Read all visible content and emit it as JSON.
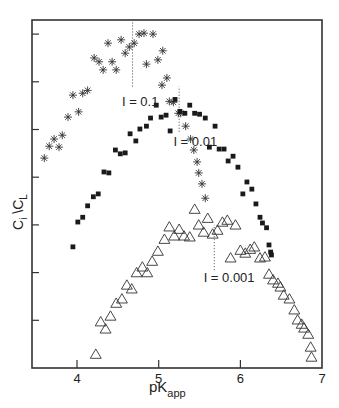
{
  "chart_data": {
    "type": "scatter",
    "title": "",
    "xlabel": "pK",
    "xlabel_subscript": "app",
    "ylabel": "C",
    "ylabel_sub1": "i",
    "ylabel_mid": " \\C",
    "ylabel_sub2": "L",
    "xlim": [
      3.45,
      7.0
    ],
    "ylim": [
      0,
      7.3
    ],
    "x_ticks": [
      4,
      5,
      6,
      7
    ],
    "x_tick_labels": [
      "4",
      "5",
      "6",
      "7"
    ],
    "y_ticks": [
      1,
      2,
      3,
      4,
      5,
      6,
      7
    ],
    "y_tick_labels": [
      "",
      "",
      "",
      "",
      "",
      "",
      ""
    ],
    "grid": false,
    "legend": "none (series labeled inline)",
    "annotations": [
      {
        "text": "I = 0.1",
        "x": 4.55,
        "y": 5.5,
        "marker_line_x": 4.68,
        "line_y": [
          5.9,
          7.3
        ]
      },
      {
        "text": "I = 0.01",
        "x": 5.18,
        "y": 4.65,
        "marker_line_x": 5.25,
        "line_y": [
          4.95,
          5.9
        ]
      },
      {
        "text": "I = 0.001",
        "x": 5.55,
        "y": 1.8,
        "marker_line_x": 5.68,
        "line_y": [
          2.05,
          3.0
        ]
      }
    ],
    "series": [
      {
        "name": "I = 0.1",
        "marker": "asterisk",
        "points": [
          [
            3.6,
            4.4
          ],
          [
            3.66,
            4.65
          ],
          [
            3.72,
            4.8
          ],
          [
            3.78,
            4.63
          ],
          [
            3.82,
            4.88
          ],
          [
            3.89,
            5.26
          ],
          [
            3.95,
            5.72
          ],
          [
            4.02,
            5.37
          ],
          [
            4.07,
            5.76
          ],
          [
            4.13,
            5.82
          ],
          [
            4.21,
            6.5
          ],
          [
            4.27,
            6.42
          ],
          [
            4.32,
            6.25
          ],
          [
            4.38,
            6.81
          ],
          [
            4.43,
            6.42
          ],
          [
            4.48,
            6.25
          ],
          [
            4.54,
            6.88
          ],
          [
            4.59,
            6.6
          ],
          [
            4.64,
            6.73
          ],
          [
            4.7,
            6.81
          ],
          [
            4.76,
            7.0
          ],
          [
            4.82,
            7.02
          ],
          [
            4.93,
            7.0
          ],
          [
            4.85,
            6.37
          ],
          [
            4.99,
            6.46
          ],
          [
            5.05,
            6.65
          ],
          [
            5.1,
            6.08
          ],
          [
            5.04,
            5.93
          ],
          [
            5.13,
            5.59
          ],
          [
            5.18,
            5.57
          ],
          [
            5.24,
            5.34
          ],
          [
            5.27,
            5.34
          ],
          [
            5.33,
            5.07
          ],
          [
            5.39,
            4.8
          ],
          [
            5.43,
            4.57
          ],
          [
            5.47,
            4.32
          ],
          [
            5.49,
            4.09
          ],
          [
            5.53,
            3.86
          ],
          [
            5.57,
            3.56
          ]
        ]
      },
      {
        "name": "I = 0.01",
        "marker": "square",
        "points": [
          [
            3.95,
            2.54
          ],
          [
            4.01,
            3.06
          ],
          [
            4.07,
            3.16
          ],
          [
            4.13,
            3.4
          ],
          [
            4.2,
            3.59
          ],
          [
            4.26,
            3.65
          ],
          [
            4.33,
            4.11
          ],
          [
            4.39,
            4.09
          ],
          [
            4.47,
            4.57
          ],
          [
            4.53,
            4.49
          ],
          [
            4.59,
            4.51
          ],
          [
            4.65,
            4.91
          ],
          [
            4.72,
            4.76
          ],
          [
            4.77,
            5.01
          ],
          [
            4.85,
            5.07
          ],
          [
            4.9,
            5.24
          ],
          [
            4.97,
            5.51
          ],
          [
            5.03,
            5.26
          ],
          [
            5.09,
            5.3
          ],
          [
            5.14,
            4.97
          ],
          [
            5.2,
            5.63
          ],
          [
            5.26,
            5.38
          ],
          [
            5.32,
            5.34
          ],
          [
            5.38,
            5.51
          ],
          [
            5.44,
            5.34
          ],
          [
            5.5,
            5.32
          ],
          [
            5.57,
            5.24
          ],
          [
            5.69,
            5.07
          ],
          [
            5.62,
            4.63
          ],
          [
            5.74,
            4.59
          ],
          [
            5.8,
            4.59
          ],
          [
            5.91,
            4.44
          ],
          [
            5.85,
            4.34
          ],
          [
            5.97,
            4.21
          ],
          [
            6.08,
            3.9
          ],
          [
            6.14,
            3.75
          ],
          [
            6.03,
            3.65
          ],
          [
            6.19,
            3.44
          ],
          [
            6.24,
            3.16
          ],
          [
            6.27,
            3.04
          ],
          [
            6.32,
            2.94
          ],
          [
            6.35,
            2.58
          ],
          [
            6.37,
            2.43
          ],
          [
            6.38,
            2.37
          ]
        ]
      },
      {
        "name": "I = 0.001",
        "marker": "triangle",
        "points": [
          [
            4.23,
            0.29
          ],
          [
            4.29,
            0.97
          ],
          [
            4.35,
            0.82
          ],
          [
            4.41,
            1.09
          ],
          [
            4.48,
            1.36
          ],
          [
            4.55,
            1.45
          ],
          [
            4.61,
            1.74
          ],
          [
            4.67,
            1.66
          ],
          [
            4.73,
            2.0
          ],
          [
            4.8,
            2.12
          ],
          [
            4.86,
            2.0
          ],
          [
            4.92,
            2.24
          ],
          [
            4.99,
            2.45
          ],
          [
            5.07,
            2.7
          ],
          [
            5.13,
            2.96
          ],
          [
            5.19,
            2.77
          ],
          [
            5.25,
            2.91
          ],
          [
            5.31,
            2.77
          ],
          [
            5.38,
            2.75
          ],
          [
            5.44,
            3.33
          ],
          [
            5.49,
            3.0
          ],
          [
            5.55,
            2.85
          ],
          [
            5.6,
            3.14
          ],
          [
            5.66,
            2.81
          ],
          [
            5.72,
            2.89
          ],
          [
            5.78,
            3.06
          ],
          [
            5.84,
            3.1
          ],
          [
            5.94,
            3.0
          ],
          [
            5.88,
            2.31
          ],
          [
            6.0,
            2.47
          ],
          [
            6.06,
            2.41
          ],
          [
            6.12,
            2.49
          ],
          [
            6.17,
            2.54
          ],
          [
            6.24,
            2.31
          ],
          [
            6.3,
            2.33
          ],
          [
            6.35,
            1.97
          ],
          [
            6.4,
            1.85
          ],
          [
            6.46,
            1.78
          ],
          [
            6.49,
            1.7
          ],
          [
            6.53,
            1.53
          ],
          [
            6.6,
            1.45
          ],
          [
            6.66,
            1.22
          ],
          [
            6.7,
            1.01
          ],
          [
            6.75,
            0.92
          ],
          [
            6.78,
            0.84
          ],
          [
            6.83,
            0.71
          ],
          [
            6.86,
            0.44
          ],
          [
            6.87,
            0.23
          ]
        ]
      }
    ]
  }
}
